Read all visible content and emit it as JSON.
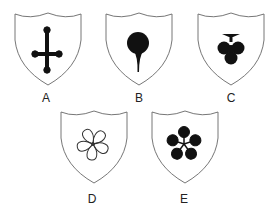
{
  "figure": {
    "shields": [
      {
        "label": "A",
        "emblem": "inverted-cross-with-ball-ends",
        "fill": "solid"
      },
      {
        "label": "B",
        "emblem": "pin-drop",
        "fill": "solid"
      },
      {
        "label": "C",
        "emblem": "club-trefoil",
        "fill": "solid"
      },
      {
        "label": "D",
        "emblem": "five-petal-flower",
        "fill": "outline"
      },
      {
        "label": "E",
        "emblem": "five-petal-flower",
        "fill": "solid"
      }
    ],
    "colors": {
      "outline": "#555555",
      "emblem": "#111111",
      "background": "#ffffff"
    }
  }
}
